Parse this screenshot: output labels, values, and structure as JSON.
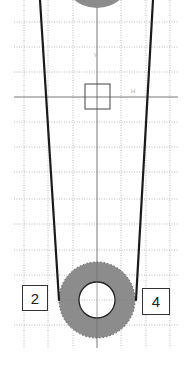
{
  "diagram": {
    "type": "pulley-belt-grid",
    "colors": {
      "background": "#ffffff",
      "grid": "#b8b8b8",
      "axis": "#555555",
      "belt": "#1a1a1a",
      "pulley_fill": "#8c8c8c",
      "pulley_hole": "#ffffff",
      "box_border": "#333333"
    },
    "grid": {
      "x_lines": [
        24,
        48,
        73,
        121,
        146,
        170
      ],
      "y_lines": [
        22,
        47,
        72,
        122,
        147,
        172,
        199,
        224,
        250,
        275,
        325
      ],
      "x_min": 14,
      "x_max": 178,
      "y_min": 0,
      "y_max": 348,
      "axis_x": 97,
      "axis_y": 97
    },
    "axis_labels": {
      "vertical": "V",
      "horizontal": "H"
    },
    "center_square": {
      "x": 85,
      "y": 84,
      "size": 25
    },
    "top_pulley": {
      "cx": 97,
      "cy": -28,
      "r": 36
    },
    "bottom_pulley": {
      "cx": 97,
      "cy": 300,
      "r_outer": 38,
      "r_inner": 18
    },
    "belt": {
      "left": {
        "x1": 40,
        "y1": 0,
        "x2": 59,
        "y2": 300
      },
      "right": {
        "x1": 153,
        "y1": 0,
        "x2": 136,
        "y2": 300
      }
    },
    "labels": [
      {
        "text": "2",
        "x": 22,
        "y": 285,
        "w": 26,
        "h": 26
      },
      {
        "text": "4",
        "x": 142,
        "y": 288,
        "w": 28,
        "h": 27
      }
    ]
  }
}
